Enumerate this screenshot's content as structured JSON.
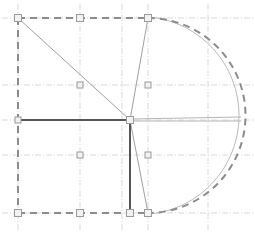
{
  "document": {
    "title": "CAD Plan View",
    "view_type": "plan",
    "background_color": "#ffffff",
    "width": 255,
    "height": 238
  },
  "palette": {
    "outline_dashed": "#8c8c8c",
    "outline_light_arc": "#b9b9b9",
    "structural_dark": "#555555",
    "construction_thin": "#a0a0a0",
    "grid_line": "#cfcfcf",
    "node_stroke": "#9a9a9a",
    "node_fill": "#f2f2f2",
    "background": "#ffffff"
  },
  "grid": {
    "style": "dash-dot",
    "visible": true,
    "vertical_lines": [
      {
        "name": "grid-v-1",
        "x": 18,
        "y1": 4,
        "y2": 232
      },
      {
        "name": "grid-v-2",
        "x": 80,
        "y1": 4,
        "y2": 232
      },
      {
        "name": "grid-v-3",
        "x": 122,
        "y1": 4,
        "y2": 232
      },
      {
        "name": "grid-v-4",
        "x": 148,
        "y1": 4,
        "y2": 232
      },
      {
        "name": "grid-v-5",
        "x": 208,
        "y1": 4,
        "y2": 232
      }
    ],
    "horizontal_lines": [
      {
        "name": "grid-h-1",
        "x1": 2,
        "x2": 253,
        "y": 18
      },
      {
        "name": "grid-h-2",
        "x1": 2,
        "x2": 253,
        "y": 85
      },
      {
        "name": "grid-h-3",
        "x1": 2,
        "x2": 253,
        "y": 120
      },
      {
        "name": "grid-h-4",
        "x1": 2,
        "x2": 253,
        "y": 155
      },
      {
        "name": "grid-h-5",
        "x1": 2,
        "x2": 253,
        "y": 213
      }
    ]
  },
  "outline": {
    "label": "building-outline-dashed",
    "stroke": "#8c8c8c",
    "stroke_width": 2,
    "dash_pattern": "7 5",
    "segments": [
      {
        "name": "outline-top-edge",
        "type": "line",
        "x1": 18,
        "y1": 18,
        "x2": 148,
        "y2": 18
      },
      {
        "name": "outline-left-edge",
        "type": "line",
        "x1": 18,
        "y1": 18,
        "x2": 18,
        "y2": 213
      },
      {
        "name": "outline-bottom-edge",
        "type": "line",
        "x1": 18,
        "y1": 213,
        "x2": 148,
        "y2": 213
      },
      {
        "name": "outline-right-arc",
        "type": "arc",
        "x1": 148,
        "y1": 18,
        "x2": 148,
        "y2": 213,
        "rx": 97,
        "ry": 97,
        "sweep": 1
      }
    ]
  },
  "secondary_arc": {
    "label": "offset-arc-light",
    "stroke": "#b9b9b9",
    "stroke_width": 1,
    "x1": 150,
    "y1": 17,
    "x2": 150,
    "y2": 214,
    "rx": 99,
    "ry": 99
  },
  "structural_lines": [
    {
      "name": "wall-horizontal-main",
      "stroke": "#555555",
      "stroke_width": 2,
      "x1": 18,
      "y1": 120,
      "x2": 130,
      "y2": 120
    },
    {
      "name": "wall-vertical-main",
      "stroke": "#555555",
      "stroke_width": 2,
      "x1": 130,
      "y1": 120,
      "x2": 130,
      "y2": 213
    }
  ],
  "construction_lines": [
    {
      "name": "diagonal-topleft-to-hub",
      "stroke": "#a0a0a0",
      "stroke_width": 1,
      "x1": 18,
      "y1": 18,
      "x2": 130,
      "y2": 120
    },
    {
      "name": "diagonal-topright-to-hub",
      "stroke": "#a0a0a0",
      "stroke_width": 1,
      "x1": 148,
      "y1": 18,
      "x2": 130,
      "y2": 120
    },
    {
      "name": "diagonal-hub-to-bottomright",
      "stroke": "#a0a0a0",
      "stroke_width": 1,
      "x1": 130,
      "y1": 120,
      "x2": 148,
      "y2": 213
    },
    {
      "name": "radius-hub-to-arc-upper",
      "stroke": "#b5b5b5",
      "stroke_width": 1,
      "x1": 130,
      "y1": 119,
      "x2": 241,
      "y2": 117
    },
    {
      "name": "radius-hub-to-arc-lower",
      "stroke": "#b5b5b5",
      "stroke_width": 1,
      "x1": 130,
      "y1": 121,
      "x2": 241,
      "y2": 121
    }
  ],
  "nodes": [
    {
      "name": "node-corner-top-left",
      "x": 18,
      "y": 18,
      "size": 7,
      "emphasis": "corner"
    },
    {
      "name": "node-top-mid",
      "x": 80,
      "y": 18,
      "size": 7,
      "emphasis": "corner"
    },
    {
      "name": "node-top-right",
      "x": 148,
      "y": 18,
      "size": 7,
      "emphasis": "corner"
    },
    {
      "name": "node-grid-left-upper",
      "x": 80,
      "y": 85,
      "size": 6,
      "emphasis": "grid"
    },
    {
      "name": "node-grid-right-upper",
      "x": 148,
      "y": 85,
      "size": 6,
      "emphasis": "grid"
    },
    {
      "name": "node-wall-left-end",
      "x": 18,
      "y": 120,
      "size": 6,
      "emphasis": "endpoint"
    },
    {
      "name": "node-hub-center",
      "x": 130,
      "y": 120,
      "size": 7,
      "emphasis": "hub"
    },
    {
      "name": "node-grid-left-lower",
      "x": 80,
      "y": 155,
      "size": 6,
      "emphasis": "grid"
    },
    {
      "name": "node-grid-right-lower",
      "x": 148,
      "y": 155,
      "size": 6,
      "emphasis": "grid"
    },
    {
      "name": "node-corner-bottom-left",
      "x": 18,
      "y": 213,
      "size": 7,
      "emphasis": "corner"
    },
    {
      "name": "node-bottom-mid",
      "x": 80,
      "y": 213,
      "size": 7,
      "emphasis": "corner"
    },
    {
      "name": "node-wall-bottom-end",
      "x": 130,
      "y": 213,
      "size": 7,
      "emphasis": "endpoint"
    },
    {
      "name": "node-corner-bottom-right",
      "x": 148,
      "y": 213,
      "size": 7,
      "emphasis": "corner"
    }
  ]
}
